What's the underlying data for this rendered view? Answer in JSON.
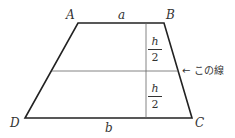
{
  "diagram": {
    "type": "trapezoid",
    "vertices": {
      "A": "A",
      "B": "B",
      "C": "C",
      "D": "D"
    },
    "top_side_label": "a",
    "bottom_side_label": "b",
    "upper_height": {
      "num": "h",
      "den": "2"
    },
    "lower_height": {
      "num": "h",
      "den": "2"
    },
    "midline_note": "← この線"
  }
}
